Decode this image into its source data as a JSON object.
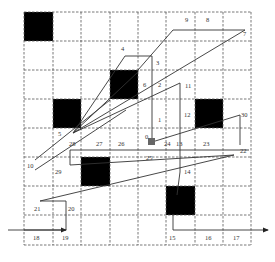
{
  "diagram": {
    "title": "",
    "grid": {
      "cols": 8,
      "rows": 8,
      "x_lines": [
        24,
        53,
        81,
        110,
        138,
        166,
        195,
        223,
        251
      ],
      "y_lines": [
        12,
        41,
        70,
        99,
        128,
        157,
        186,
        215,
        245
      ]
    },
    "obstacles": [
      {
        "col": 0,
        "row": 0
      },
      {
        "col": 3,
        "row": 2
      },
      {
        "col": 1,
        "row": 3
      },
      {
        "col": 6,
        "row": 3
      },
      {
        "col": 2,
        "row": 5
      },
      {
        "col": 5,
        "row": 6
      }
    ],
    "start_marker": {
      "x": 152,
      "y": 142,
      "color": "#666666"
    },
    "colors": {
      "obstacle": "#000000",
      "grid": "#555555",
      "path": "#333333",
      "start": "#666666"
    },
    "entry_arrow": {
      "x1": 8,
      "y1": 230,
      "x2": 24,
      "y2": 230
    },
    "exit_arrow": {
      "x1": 251,
      "y1": 230,
      "x2": 268,
      "y2": 230
    },
    "path_points": [
      [
        8,
        230
      ],
      [
        66,
        230
      ],
      [
        66,
        201
      ],
      [
        40,
        201
      ],
      [
        234,
        155
      ],
      [
        70,
        165
      ],
      [
        70,
        150
      ],
      [
        249,
        150
      ],
      [
        249,
        139
      ],
      [
        240,
        144
      ],
      [
        240,
        200
      ],
      [
        234,
        155
      ],
      [
        152,
        142
      ],
      [
        152,
        56
      ],
      [
        125,
        56
      ],
      [
        73,
        133
      ],
      [
        140,
        70
      ],
      [
        73,
        133
      ],
      [
        145,
        84
      ],
      [
        73,
        133
      ],
      [
        180,
        84
      ],
      [
        180,
        160
      ],
      [
        175,
        190
      ],
      [
        175,
        230
      ],
      [
        268,
        230
      ]
    ],
    "waypoint_labels": [
      {
        "text": "0",
        "x": 145,
        "y": 139
      },
      {
        "text": "1",
        "x": 158,
        "y": 122
      },
      {
        "text": "2",
        "x": 158,
        "y": 87
      },
      {
        "text": "3",
        "x": 156,
        "y": 65
      },
      {
        "text": "4",
        "x": 121,
        "y": 51
      },
      {
        "text": "5",
        "x": 58,
        "y": 136
      },
      {
        "text": "6",
        "x": 143,
        "y": 87
      },
      {
        "text": "7",
        "x": 243,
        "y": 36
      },
      {
        "text": "8",
        "x": 206,
        "y": 22
      },
      {
        "text": "9",
        "x": 185,
        "y": 22
      },
      {
        "text": "10",
        "x": 27,
        "y": 168
      },
      {
        "text": "11",
        "x": 185,
        "y": 88
      },
      {
        "text": "12",
        "x": 184,
        "y": 117
      },
      {
        "text": "13",
        "x": 176,
        "y": 146
      },
      {
        "text": "14",
        "x": 184,
        "y": 174
      },
      {
        "text": "15",
        "x": 169,
        "y": 240
      },
      {
        "text": "16",
        "x": 205,
        "y": 240
      },
      {
        "text": "17",
        "x": 233,
        "y": 240
      },
      {
        "text": "18",
        "x": 33,
        "y": 240
      },
      {
        "text": "19",
        "x": 62,
        "y": 240
      },
      {
        "text": "20",
        "x": 68,
        "y": 211
      },
      {
        "text": "21",
        "x": 34,
        "y": 211
      },
      {
        "text": "22",
        "x": 240,
        "y": 153
      },
      {
        "text": "23",
        "x": 203,
        "y": 146
      },
      {
        "text": "24",
        "x": 164,
        "y": 146
      },
      {
        "text": "25",
        "x": 146,
        "y": 160
      },
      {
        "text": "26",
        "x": 118,
        "y": 146
      },
      {
        "text": "27",
        "x": 96,
        "y": 146
      },
      {
        "text": "28",
        "x": 69,
        "y": 146
      },
      {
        "text": "29",
        "x": 55,
        "y": 174
      },
      {
        "text": "30",
        "x": 241,
        "y": 117
      }
    ]
  }
}
